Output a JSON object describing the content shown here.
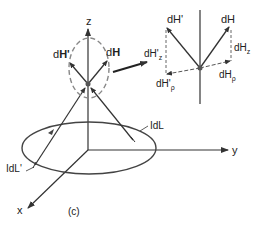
{
  "figure": {
    "caption": "(c)",
    "axes": {
      "x": "x",
      "y": "y",
      "z": "z"
    },
    "current_elements": {
      "left": "IdL'",
      "right": "IdL"
    },
    "field_vectors": {
      "primary": "dH",
      "secondary": "dH'"
    },
    "inset": {
      "dH": "dH",
      "dH_prime": "dH'",
      "dH_z": "dH",
      "dH_z_sub": "z",
      "dH_prime_z": "dH'",
      "dH_prime_z_sub": "z",
      "dH_rho": "dH",
      "dH_rho_sub": "ρ",
      "dH_prime_rho": "dH'",
      "dH_prime_rho_sub": "ρ"
    },
    "colors": {
      "line": "#333333",
      "dashed": "#888888",
      "text": "#222222"
    }
  }
}
